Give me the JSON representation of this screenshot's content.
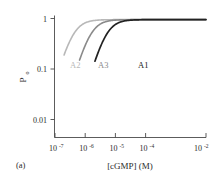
{
  "chart_data": {
    "type": "line",
    "title": "",
    "panel_label": "(a)",
    "xlabel": "[cGMP] (M)",
    "ylabel": "P_o",
    "ylabel_base": "P",
    "ylabel_sub": "o",
    "xscale": "log",
    "yscale": "log",
    "xlim": [
      1e-07,
      0.01
    ],
    "ylim": [
      0.004,
      1.0
    ],
    "grid": false,
    "legend": "inline curve labels",
    "x_ticks": [
      {
        "value": 1e-07,
        "label": "10",
        "exponent": "-7"
      },
      {
        "value": 1e-06,
        "label": "10",
        "exponent": "-6"
      },
      {
        "value": 1e-05,
        "label": "10",
        "exponent": "-5"
      },
      {
        "value": 0.0001,
        "label": "10",
        "exponent": "-4"
      },
      {
        "value": 0.01,
        "label": "10",
        "exponent": "-2"
      }
    ],
    "y_ticks": [
      {
        "value": 1.0,
        "label": "1"
      },
      {
        "value": 0.1,
        "label": "0.1"
      },
      {
        "value": 0.01,
        "label": "0.01"
      }
    ],
    "series": [
      {
        "name": "A2",
        "label": "A2",
        "color": "#b8b8b8",
        "ec50": 4e-07,
        "hill": 2.0,
        "max": 0.95,
        "label_x": 70,
        "label_y": 68,
        "x": [
          2e-07,
          3e-07,
          4e-07,
          6e-07,
          1e-06,
          2e-06,
          4e-06,
          1e-05,
          0.0001,
          0.01
        ],
        "y": [
          0.01,
          0.27,
          0.48,
          0.69,
          0.86,
          0.93,
          0.945,
          0.95,
          0.95,
          0.95
        ]
      },
      {
        "name": "A3",
        "label": "A3",
        "color": "#8a8a8a",
        "ec50": 1.5e-06,
        "hill": 2.0,
        "max": 0.95,
        "label_x": 98,
        "label_y": 68,
        "x": [
          6.5e-07,
          1e-06,
          1.5e-06,
          2.5e-06,
          4e-06,
          8e-06,
          2e-05,
          0.0001,
          0.01
        ],
        "y": [
          0.004,
          0.18,
          0.48,
          0.73,
          0.87,
          0.93,
          0.948,
          0.95,
          0.95
        ]
      },
      {
        "name": "A1",
        "label": "A1",
        "color": "#222222",
        "ec50": 5e-06,
        "hill": 2.0,
        "max": 0.95,
        "label_x": 138,
        "label_y": 68,
        "x": [
          2.1e-06,
          3.2e-06,
          5e-06,
          8e-06,
          1.3e-05,
          2.5e-05,
          6e-05,
          0.0003,
          0.01
        ],
        "y": [
          0.004,
          0.17,
          0.48,
          0.73,
          0.87,
          0.935,
          0.948,
          0.95,
          0.95
        ]
      }
    ]
  },
  "figure": {
    "background": "#ffffff",
    "axis_color": "#4a4a4a",
    "text_color": "#2b2b2b"
  }
}
